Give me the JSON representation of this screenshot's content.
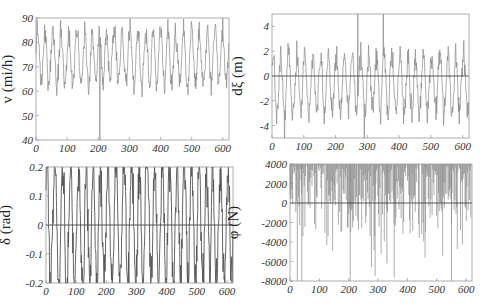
{
  "chart_data": [
    {
      "type": "line",
      "title": "",
      "xlabel": "",
      "ylabel": "v (mi/h)",
      "xlim": [
        0,
        620
      ],
      "ylim": [
        40,
        90
      ],
      "xticks": [
        "0",
        "100",
        "200",
        "300",
        "400",
        "500",
        "600"
      ],
      "yticks": [
        "40",
        "50",
        "60",
        "70",
        "80",
        "90"
      ],
      "grid": false,
      "zero_line": false,
      "box": {
        "x0": 36,
        "y0": 18,
        "x1": 229,
        "y1": 140
      },
      "series": [
        {
          "name": "velocity",
          "color": "#8a8a8a",
          "seed": 11,
          "center": 74,
          "amp": 12,
          "clip": [
            40,
            90
          ],
          "min_spike": {
            "x": 205,
            "y": 40
          }
        }
      ]
    },
    {
      "type": "line",
      "title": "",
      "xlabel": "",
      "ylabel": "dξ (m)",
      "xlim": [
        0,
        620
      ],
      "ylim": [
        -5,
        5
      ],
      "xticks": [
        "0",
        "100",
        "200",
        "300",
        "400",
        "500",
        "600"
      ],
      "yticks": [
        "-4",
        "-2",
        "0",
        "2",
        "4"
      ],
      "grid": false,
      "zero_line": true,
      "box": {
        "x0": 272,
        "y0": 14,
        "x1": 469,
        "y1": 138
      },
      "series": [
        {
          "name": "lateral deviation",
          "color": "#8a8a8a",
          "seed": 23,
          "center": -0.6,
          "amp": 2.6,
          "clip": [
            -5,
            5
          ],
          "spikes": [
            {
              "x": 40,
              "y": -5
            },
            {
              "x": 270,
              "y": 5
            },
            {
              "x": 290,
              "y": -5
            },
            {
              "x": 350,
              "y": 5
            }
          ]
        }
      ]
    },
    {
      "type": "line",
      "title": "",
      "xlabel": "",
      "ylabel": "δ (rad)",
      "xlim": [
        0,
        620
      ],
      "ylim": [
        -0.2,
        0.2
      ],
      "xticks": [
        "0",
        "100",
        "200",
        "300",
        "400",
        "500",
        "600"
      ],
      "yticks": [
        "-0.2",
        "-0.1",
        "0",
        "0.1",
        "0.2"
      ],
      "grid": false,
      "zero_line": true,
      "box": {
        "x0": 46,
        "y0": 167,
        "x1": 233,
        "y1": 283
      },
      "series": [
        {
          "name": "steering angle",
          "color": "#555555",
          "seed": 37,
          "center": 0,
          "amp": 0.24,
          "clip": [
            -0.2,
            0.2
          ]
        }
      ]
    },
    {
      "type": "line",
      "title": "",
      "xlabel": "",
      "ylabel": "φ (N)",
      "xlim": [
        0,
        620
      ],
      "ylim": [
        -8000,
        4000
      ],
      "xticks": [
        "0",
        "100",
        "200",
        "300",
        "400",
        "500",
        "600"
      ],
      "yticks": [
        "-8000",
        "-6000",
        "-4000",
        "-2000",
        "0",
        "2000",
        "4000"
      ],
      "grid": false,
      "zero_line": true,
      "box": {
        "x0": 290,
        "y0": 164,
        "x1": 472,
        "y1": 281
      },
      "series": [
        {
          "name": "force",
          "color": "#8a8a8a",
          "seed": 53,
          "center": 4000,
          "amp": 0,
          "clip": [
            -8000,
            4000
          ],
          "spikes": [
            {
              "x": 25,
              "y": -8000
            },
            {
              "x": 40,
              "y": -8000
            },
            {
              "x": 205,
              "y": -8000
            },
            {
              "x": 290,
              "y": -7500
            },
            {
              "x": 330,
              "y": -6200
            },
            {
              "x": 355,
              "y": -7600
            },
            {
              "x": 460,
              "y": -5600
            },
            {
              "x": 520,
              "y": -5400
            },
            {
              "x": 550,
              "y": -8000
            }
          ]
        }
      ]
    }
  ]
}
